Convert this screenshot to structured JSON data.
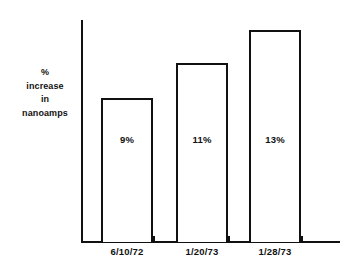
{
  "chart_data": {
    "type": "bar",
    "title": "",
    "subtitle": "",
    "xlabel": "",
    "ylabel": "% increase in nanoamps",
    "ylabel_lines": [
      "%",
      "increase",
      "in",
      "nanoamps"
    ],
    "categories": [
      "6/10/72",
      "1/20/73",
      "1/28/73"
    ],
    "values": [
      9,
      11,
      13
    ],
    "value_labels": [
      "9%",
      "11%",
      "13%"
    ],
    "unit": "%",
    "ylim": [
      0,
      16
    ],
    "grid": false,
    "legend": false,
    "legend_position": "none",
    "bar_style": {
      "fill": "#ffffff",
      "outline": "#111111",
      "outline_width_px": 2
    },
    "axis_color": "#111111",
    "background": "#ffffff",
    "annotations": []
  },
  "bars": [
    {
      "name": "bar-1",
      "category": "6/10/72",
      "value": 9,
      "value_label": "9%",
      "left_px": 101,
      "top_px": 98,
      "width_px": 52,
      "height_px": 144,
      "tick_px": 101,
      "label_left_px": 96,
      "label_width_px": 62
    },
    {
      "name": "bar-2",
      "category": "1/20/73",
      "value": 11,
      "value_label": "11%",
      "left_px": 176,
      "top_px": 63,
      "width_px": 52,
      "height_px": 179,
      "tick_px": 176,
      "label_left_px": 171,
      "label_width_px": 62
    },
    {
      "name": "bar-3",
      "category": "1/28/73",
      "value": 13,
      "value_label": "13%",
      "left_px": 249,
      "top_px": 30,
      "width_px": 52,
      "height_px": 212,
      "tick_px": 249,
      "label_left_px": 244,
      "label_width_px": 62
    }
  ],
  "extra_ticks_px": [
    153,
    228,
    301
  ],
  "value_label_top_px": 134
}
